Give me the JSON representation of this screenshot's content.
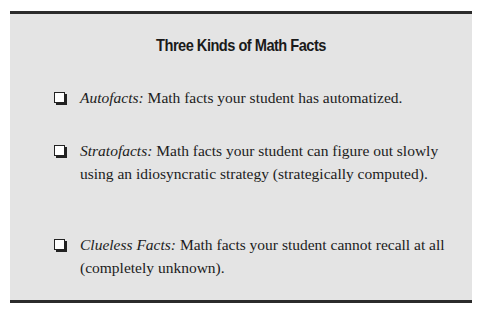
{
  "box": {
    "title": "Three Kinds of Math Facts",
    "items": [
      {
        "icon": "checkbox-icon",
        "term": "Autofacts:",
        "definition": " Math facts your student has automatized."
      },
      {
        "icon": "checkbox-icon",
        "term": "Stratofacts:",
        "definition": " Math facts your student can figure out slowly using an idiosyncratic strategy (strategically computed)."
      },
      {
        "icon": "checkbox-icon",
        "term": "Clueless Facts:",
        "definition": " Math facts your student cannot recall at all (completely unknown)."
      }
    ]
  },
  "colors": {
    "box_background": "#e4e4e4",
    "rule": "#2b2b2b",
    "text": "#1c1c1c"
  }
}
